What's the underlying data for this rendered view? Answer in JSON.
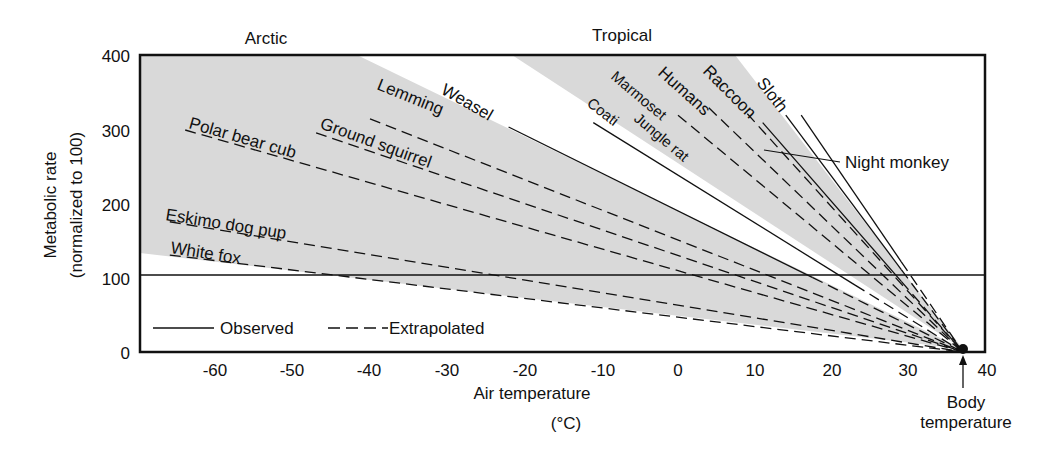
{
  "chart_data": {
    "type": "line",
    "title": "",
    "xlabel": "Air temperature",
    "xlabel_unit": "(°C)",
    "ylabel": "Metabolic rate",
    "ylabel_sub": "(normalized to 100)",
    "xlim": [
      -70,
      40
    ],
    "ylim": [
      0,
      400
    ],
    "x_ticks": [
      -60,
      -50,
      -40,
      -30,
      -20,
      -10,
      0,
      10,
      20,
      30,
      40
    ],
    "y_ticks": [
      0,
      100,
      200,
      300,
      400
    ],
    "grid": false,
    "reference_line": {
      "y": 100
    },
    "region_labels": [
      {
        "text": "Arctic",
        "x": -56
      },
      {
        "text": "Tropical",
        "x": 12
      }
    ],
    "body_temperature": {
      "x": 37,
      "y": 0,
      "label_line1": "Body",
      "label_line2": "temperature"
    },
    "legend": [
      {
        "text": "Observed",
        "style": "solid"
      },
      {
        "text": "Extrapolated",
        "style": "dashed"
      }
    ],
    "series": [
      {
        "name": "White fox",
        "group": "arctic",
        "start": [
          -66,
          131
        ],
        "end": [
          37,
          0
        ],
        "style": "dashed"
      },
      {
        "name": "Eskimo dog pup",
        "group": "arctic",
        "start": [
          -66,
          176
        ],
        "end": [
          37,
          0
        ],
        "style": "dashed"
      },
      {
        "name": "Polar bear cub",
        "group": "arctic",
        "start": [
          -64,
          300
        ],
        "end": [
          37,
          0
        ],
        "style": "dashed"
      },
      {
        "name": "Ground squirrel",
        "group": "arctic",
        "start": [
          -47,
          296
        ],
        "end": [
          37,
          0
        ],
        "style": "dashed"
      },
      {
        "name": "Lemming",
        "group": "arctic",
        "start": [
          -40,
          315
        ],
        "end": [
          37,
          0
        ],
        "style": "dashed"
      },
      {
        "name": "Weasel",
        "group": "arctic",
        "start": [
          -22,
          304
        ],
        "end": [
          37,
          0
        ],
        "style": "solid_then_dashed",
        "observed_until": 17.5
      },
      {
        "name": "Coati",
        "group": "tropical",
        "start": [
          -11,
          310
        ],
        "end": [
          37,
          0
        ],
        "style": "solid_then_dashed",
        "observed_until": 23
      },
      {
        "name": "Jungle rat",
        "group": "tropical",
        "start": [
          0,
          320
        ],
        "end": [
          37,
          0
        ],
        "style": "dashed"
      },
      {
        "name": "Marmoset",
        "group": "tropical",
        "start": [
          4,
          330
        ],
        "end": [
          37,
          0
        ],
        "style": "dashed"
      },
      {
        "name": "Humans",
        "group": "tropical",
        "start": [
          9,
          322
        ],
        "end": [
          37,
          0
        ],
        "style": "dashed"
      },
      {
        "name": "Raccoon",
        "group": "tropical",
        "start": [
          14,
          320
        ],
        "end": [
          37,
          0
        ],
        "style": "solid_then_dashed",
        "observed_until": 29
      },
      {
        "name": "Night monkey",
        "group": "tropical",
        "start": [
          11,
          310
        ],
        "end": [
          37,
          0
        ],
        "style": "solid_then_dashed",
        "observed_until": 29
      },
      {
        "name": "Sloth",
        "group": "tropical",
        "start": [
          16,
          320
        ],
        "end": [
          37,
          0
        ],
        "style": "solid_then_dashed",
        "observed_until": 29
      }
    ]
  },
  "labels": {
    "arctic": "Arctic",
    "tropical": "Tropical",
    "xlabel": "Air temperature",
    "xunit": "(°C)",
    "ylabel": "Metabolic rate",
    "ylabel_sub": "(normalized to 100)",
    "legend_observed": "Observed",
    "legend_extrapolated": "Extrapolated",
    "body1": "Body",
    "body2": "temperature",
    "white_fox": "White fox",
    "eskimo": "Eskimo dog pup",
    "polar": "Polar bear cub",
    "ground": "Ground squirrel",
    "lemming": "Lemming",
    "weasel": "Weasel",
    "coati": "Coati",
    "jungle": "Jungle rat",
    "marmoset": "Marmoset",
    "humans": "Humans",
    "raccoon": "Raccoon",
    "sloth": "Sloth",
    "night_monkey": "Night monkey"
  },
  "colors": {
    "band": "#d9d9d9",
    "ink": "#111111"
  }
}
